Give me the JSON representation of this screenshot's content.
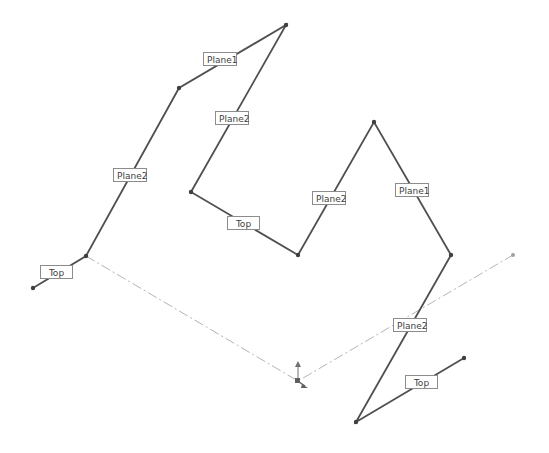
{
  "viewport": {
    "width": 549,
    "height": 453,
    "background": "#ffffff"
  },
  "colors": {
    "sketch_line": "#505050",
    "construction_line": "#b4b4b4",
    "label_border": "#8c8c8c",
    "label_text": "#404040"
  },
  "sketch_paths": [
    {
      "name": "left-path",
      "points": [
        [
          33,
          288
        ],
        [
          86,
          256
        ],
        [
          179,
          88
        ],
        [
          286,
          25
        ],
        [
          191,
          192
        ],
        [
          298,
          255
        ],
        [
          374,
          122
        ],
        [
          451,
          255
        ],
        [
          356,
          422
        ],
        [
          464,
          358
        ]
      ]
    }
  ],
  "construction_line": {
    "points": [
      [
        86,
        256
      ],
      [
        298,
        381
      ],
      [
        513,
        255
      ]
    ]
  },
  "origin": {
    "x": 298,
    "y": 381
  },
  "labels": [
    {
      "id": "label-top-1",
      "text": "Top",
      "x": 40,
      "y": 265,
      "w": 33
    },
    {
      "id": "label-plane2-1",
      "text": "Plane2",
      "x": 113,
      "y": 168,
      "w": 34
    },
    {
      "id": "label-plane1-1",
      "text": "Plane1",
      "x": 203,
      "y": 52,
      "w": 34
    },
    {
      "id": "label-plane2-2",
      "text": "Plane2",
      "x": 215,
      "y": 111,
      "w": 34
    },
    {
      "id": "label-top-2",
      "text": "Top",
      "x": 227,
      "y": 216,
      "w": 33
    },
    {
      "id": "label-plane2-3",
      "text": "Plane2",
      "x": 312,
      "y": 191,
      "w": 34
    },
    {
      "id": "label-plane1-2",
      "text": "Plane1",
      "x": 395,
      "y": 183,
      "w": 34
    },
    {
      "id": "label-plane2-4",
      "text": "Plane2",
      "x": 393,
      "y": 318,
      "w": 34
    },
    {
      "id": "label-top-3",
      "text": "Top",
      "x": 405,
      "y": 375,
      "w": 33
    }
  ]
}
